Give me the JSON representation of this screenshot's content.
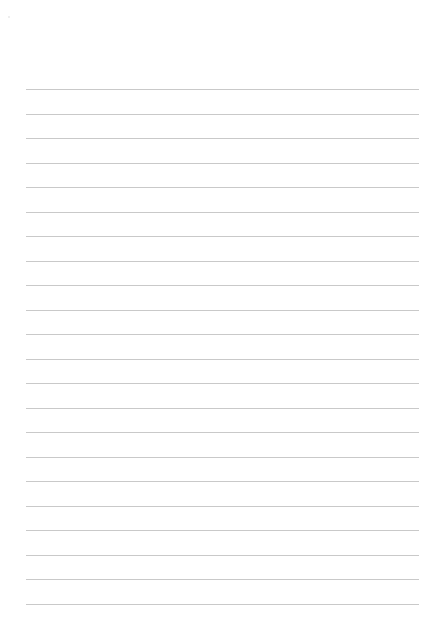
{
  "document": {
    "type": "lined-paper",
    "line_count": 22,
    "line_color": "#c9c9c9",
    "background_color": "#ffffff",
    "text_content": []
  }
}
